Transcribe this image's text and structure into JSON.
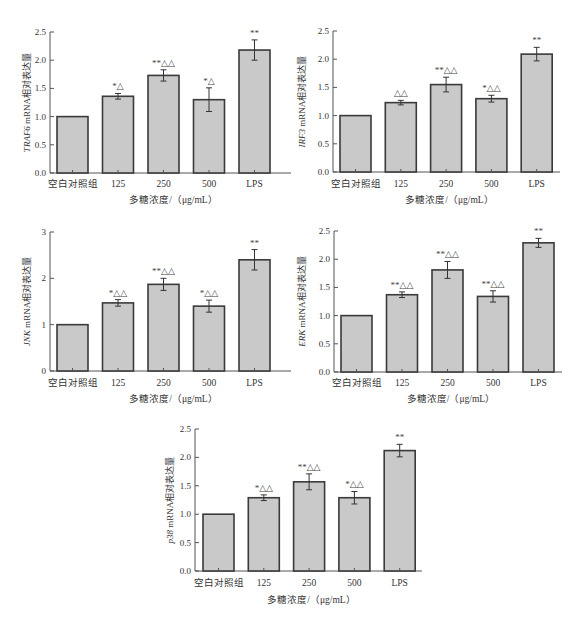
{
  "figure": {
    "categories": [
      "空白对照组",
      "125",
      "250",
      "500",
      "LPS"
    ],
    "xlabel": "多糖浓度/（μg/mL）",
    "bar_fill": "#c9c9c9",
    "bar_stroke": "#3a3a3a"
  },
  "chart_data": [
    {
      "type": "bar",
      "id": "traf6",
      "title": "",
      "gene": "TRAF6",
      "ylabel": "TRAF6 mRNA相对表达量",
      "ylabel_gene": "TRAF6",
      "ylabel_rest": " mRNA相对表达量",
      "xlabel": "多糖浓度/（μg/mL）",
      "categories": [
        "空白对照组",
        "125",
        "250",
        "500",
        "LPS"
      ],
      "values": [
        1.0,
        1.36,
        1.73,
        1.3,
        2.18
      ],
      "errors": [
        0.0,
        0.05,
        0.1,
        0.21,
        0.18
      ],
      "annotations": [
        "",
        "*△",
        "**△△",
        "*△",
        "**"
      ],
      "ylim": [
        0,
        2.5
      ],
      "yticks": [
        "0.0",
        "0.5",
        "1.0",
        "1.5",
        "2.0",
        "2.5"
      ],
      "grid": false,
      "legend": null
    },
    {
      "type": "bar",
      "id": "irf3",
      "title": "",
      "gene": "IRF3",
      "ylabel": "IRF3 mRNA相对表达量",
      "ylabel_gene": "IRF3",
      "ylabel_rest": " mRNA相对表达量",
      "xlabel": "多糖浓度/（μg/mL）",
      "categories": [
        "空白对照组",
        "125",
        "250",
        "500",
        "LPS"
      ],
      "values": [
        1.0,
        1.23,
        1.55,
        1.3,
        2.09
      ],
      "errors": [
        0.0,
        0.04,
        0.13,
        0.06,
        0.12
      ],
      "annotations": [
        "",
        "△△",
        "**△△",
        "*△△",
        "**"
      ],
      "ylim": [
        0,
        2.5
      ],
      "yticks": [
        "0.0",
        "0.5",
        "1.0",
        "1.5",
        "2.0",
        "2.5"
      ],
      "grid": false,
      "legend": null
    },
    {
      "type": "bar",
      "id": "jnk",
      "title": "",
      "gene": "JNK",
      "ylabel": "JNK mRNA相对表达量",
      "ylabel_gene": "JNK",
      "ylabel_rest": " mRNA相对表达量",
      "xlabel": "多糖浓度/（μg/mL）",
      "categories": [
        "空白对照组",
        "125",
        "250",
        "500",
        "LPS"
      ],
      "values": [
        1.0,
        1.47,
        1.87,
        1.4,
        2.4
      ],
      "errors": [
        0.0,
        0.07,
        0.13,
        0.13,
        0.22
      ],
      "annotations": [
        "",
        "*△△",
        "**△△",
        "*△△",
        "**"
      ],
      "ylim": [
        0,
        3
      ],
      "yticks": [
        "0",
        "1",
        "2",
        "3"
      ],
      "grid": false,
      "legend": null
    },
    {
      "type": "bar",
      "id": "erk",
      "title": "",
      "gene": "ERK",
      "ylabel": "ERK mRNA相对表达量",
      "ylabel_gene": "ERK",
      "ylabel_rest": " mRNA相对表达量",
      "xlabel": "多糖浓度/（μg/mL）",
      "categories": [
        "空白对照组",
        "125",
        "250",
        "500",
        "LPS"
      ],
      "values": [
        1.0,
        1.37,
        1.81,
        1.34,
        2.29
      ],
      "errors": [
        0.0,
        0.05,
        0.15,
        0.1,
        0.08
      ],
      "annotations": [
        "",
        "**△△",
        "**△△",
        "**△△",
        "**"
      ],
      "ylim": [
        0,
        2.5
      ],
      "yticks": [
        "0.0",
        "0.5",
        "1.0",
        "1.5",
        "2.0",
        "2.5"
      ],
      "grid": false,
      "legend": null
    },
    {
      "type": "bar",
      "id": "p38",
      "title": "",
      "gene": "p38",
      "ylabel": "p38 mRNA相对表达量",
      "ylabel_gene": "p38",
      "ylabel_rest": " mRNA相对表达量",
      "xlabel": "多糖浓度/（μg/mL）",
      "categories": [
        "空白对照组",
        "125",
        "250",
        "500",
        "LPS"
      ],
      "values": [
        1.0,
        1.29,
        1.57,
        1.29,
        2.12
      ],
      "errors": [
        0.0,
        0.05,
        0.14,
        0.11,
        0.11
      ],
      "annotations": [
        "",
        "*△△",
        "**△△",
        "*△△",
        "**"
      ],
      "ylim": [
        0,
        2.5
      ],
      "yticks": [
        "0.0",
        "0.5",
        "1.0",
        "1.5",
        "2.0",
        "2.5"
      ],
      "grid": false,
      "legend": null
    }
  ]
}
